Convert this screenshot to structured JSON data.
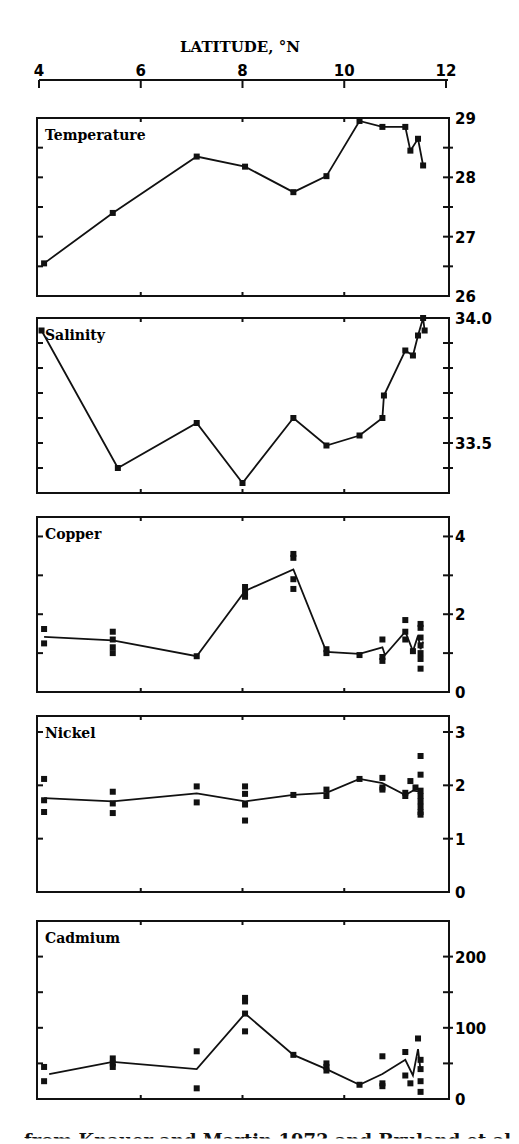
{
  "chart_data": {
    "type": "line",
    "title": "",
    "xlabel": "LATITUDE, °N",
    "x_axis": {
      "min": 4,
      "max": 12,
      "ticks": [
        4,
        6,
        8,
        10,
        12
      ],
      "tick_labels": [
        "4",
        "6",
        "8",
        "10",
        "12"
      ],
      "position": "top"
    },
    "grid": false,
    "legend": null,
    "panels": [
      {
        "name": "Temperature",
        "ylim": [
          26,
          29
        ],
        "y_ticks": [
          26,
          27,
          28,
          29
        ],
        "y_tick_labels": [
          "26",
          "27",
          "28",
          "29"
        ],
        "minor_step": 0.5,
        "line": [
          [
            4.1,
            26.55
          ],
          [
            5.45,
            27.4
          ],
          [
            7.1,
            28.35
          ],
          [
            8.05,
            28.18
          ],
          [
            9.0,
            27.75
          ],
          [
            9.65,
            28.02
          ],
          [
            10.3,
            28.95
          ],
          [
            10.75,
            28.85
          ],
          [
            11.2,
            28.85
          ],
          [
            11.3,
            28.45
          ],
          [
            11.45,
            28.65
          ],
          [
            11.55,
            28.2
          ]
        ],
        "points": [
          [
            4.1,
            26.55
          ],
          [
            5.45,
            27.4
          ],
          [
            7.1,
            28.35
          ],
          [
            8.05,
            28.18
          ],
          [
            9.0,
            27.75
          ],
          [
            9.65,
            28.02
          ],
          [
            10.3,
            28.95
          ],
          [
            10.75,
            28.85
          ],
          [
            11.2,
            28.85
          ],
          [
            11.3,
            28.45
          ],
          [
            11.45,
            28.65
          ],
          [
            11.55,
            28.2
          ]
        ]
      },
      {
        "name": "Salinity",
        "ylim": [
          33.3,
          34.0
        ],
        "y_ticks": [
          33.5,
          34.0
        ],
        "y_tick_labels": [
          "33.5",
          "34.0"
        ],
        "minor_step": 0.1,
        "line": [
          [
            4.05,
            33.95
          ],
          [
            5.55,
            33.4
          ],
          [
            7.1,
            33.58
          ],
          [
            8.0,
            33.34
          ],
          [
            9.0,
            33.6
          ],
          [
            9.65,
            33.49
          ],
          [
            10.3,
            33.53
          ],
          [
            10.75,
            33.6
          ],
          [
            10.78,
            33.69
          ],
          [
            11.2,
            33.87
          ],
          [
            11.35,
            33.85
          ],
          [
            11.45,
            33.93
          ],
          [
            11.55,
            34.0
          ],
          [
            11.58,
            33.95
          ]
        ],
        "points": [
          [
            4.05,
            33.95
          ],
          [
            5.55,
            33.4
          ],
          [
            7.1,
            33.58
          ],
          [
            8.0,
            33.34
          ],
          [
            9.0,
            33.6
          ],
          [
            9.65,
            33.49
          ],
          [
            10.3,
            33.53
          ],
          [
            10.75,
            33.6
          ],
          [
            10.78,
            33.69
          ],
          [
            11.2,
            33.87
          ],
          [
            11.35,
            33.85
          ],
          [
            11.45,
            33.93
          ],
          [
            11.55,
            34.0
          ],
          [
            11.58,
            33.95
          ]
        ]
      },
      {
        "name": "Copper",
        "ylim": [
          0,
          4.5
        ],
        "y_ticks": [
          0,
          2,
          4
        ],
        "y_tick_labels": [
          "0",
          "2",
          "4"
        ],
        "minor_step": 1,
        "line": [
          [
            4.1,
            1.42
          ],
          [
            5.45,
            1.33
          ],
          [
            7.1,
            0.92
          ],
          [
            8.05,
            2.6
          ],
          [
            9.0,
            3.15
          ],
          [
            9.65,
            1.03
          ],
          [
            10.3,
            0.98
          ],
          [
            10.75,
            1.15
          ],
          [
            10.8,
            0.95
          ],
          [
            11.2,
            1.55
          ],
          [
            11.35,
            1.05
          ],
          [
            11.45,
            1.45
          ],
          [
            11.5,
            1.1
          ],
          [
            11.55,
            1.3
          ]
        ],
        "points": [
          [
            4.1,
            1.62
          ],
          [
            4.1,
            1.25
          ],
          [
            5.45,
            1.55
          ],
          [
            5.45,
            1.35
          ],
          [
            5.45,
            1.15
          ],
          [
            5.45,
            1.0
          ],
          [
            7.1,
            0.92
          ],
          [
            8.05,
            2.7
          ],
          [
            8.05,
            2.55
          ],
          [
            8.05,
            2.45
          ],
          [
            9.0,
            3.55
          ],
          [
            9.0,
            3.45
          ],
          [
            9.0,
            2.9
          ],
          [
            9.0,
            2.65
          ],
          [
            9.65,
            1.1
          ],
          [
            9.65,
            1.0
          ],
          [
            10.3,
            0.95
          ],
          [
            10.75,
            1.35
          ],
          [
            10.75,
            0.9
          ],
          [
            10.75,
            0.8
          ],
          [
            11.2,
            1.85
          ],
          [
            11.2,
            1.55
          ],
          [
            11.2,
            1.35
          ],
          [
            11.35,
            1.05
          ],
          [
            11.5,
            1.75
          ],
          [
            11.5,
            1.65
          ],
          [
            11.5,
            1.4
          ],
          [
            11.5,
            1.2
          ],
          [
            11.5,
            1.0
          ],
          [
            11.5,
            0.85
          ],
          [
            11.5,
            0.6
          ]
        ]
      },
      {
        "name": "Nickel",
        "ylim": [
          0,
          3.3
        ],
        "y_ticks": [
          0,
          1,
          2,
          3
        ],
        "y_tick_labels": [
          "0",
          "1",
          "2",
          "3"
        ],
        "minor_step": 1,
        "line": [
          [
            4.1,
            1.76
          ],
          [
            5.45,
            1.7
          ],
          [
            7.1,
            1.85
          ],
          [
            8.05,
            1.7
          ],
          [
            9.0,
            1.82
          ],
          [
            9.65,
            1.86
          ],
          [
            10.3,
            2.12
          ],
          [
            10.75,
            2.04
          ],
          [
            11.2,
            1.82
          ],
          [
            11.35,
            1.9
          ],
          [
            11.5,
            1.88
          ]
        ],
        "points": [
          [
            4.1,
            2.12
          ],
          [
            4.1,
            1.72
          ],
          [
            4.1,
            1.5
          ],
          [
            5.45,
            1.88
          ],
          [
            5.45,
            1.66
          ],
          [
            5.45,
            1.48
          ],
          [
            7.1,
            1.98
          ],
          [
            7.1,
            1.68
          ],
          [
            8.05,
            1.98
          ],
          [
            8.05,
            1.84
          ],
          [
            8.05,
            1.64
          ],
          [
            8.05,
            1.34
          ],
          [
            9.0,
            1.82
          ],
          [
            9.65,
            1.92
          ],
          [
            9.65,
            1.8
          ],
          [
            10.3,
            2.12
          ],
          [
            10.75,
            2.14
          ],
          [
            10.75,
            1.96
          ],
          [
            10.75,
            1.92
          ],
          [
            11.2,
            1.8
          ],
          [
            11.2,
            1.86
          ],
          [
            11.3,
            2.08
          ],
          [
            11.4,
            1.96
          ],
          [
            11.5,
            2.55
          ],
          [
            11.5,
            2.2
          ],
          [
            11.5,
            1.9
          ],
          [
            11.5,
            1.8
          ],
          [
            11.5,
            1.7
          ],
          [
            11.5,
            1.6
          ],
          [
            11.5,
            1.5
          ],
          [
            11.5,
            1.45
          ]
        ]
      },
      {
        "name": "Cadmium",
        "ylim": [
          0,
          250
        ],
        "y_ticks": [
          0,
          100,
          200
        ],
        "y_tick_labels": [
          "0",
          "100",
          "200"
        ],
        "minor_step": 50,
        "line": [
          [
            4.2,
            35
          ],
          [
            5.45,
            52
          ],
          [
            7.1,
            42
          ],
          [
            8.05,
            120
          ],
          [
            9.0,
            62
          ],
          [
            9.65,
            42
          ],
          [
            10.3,
            20
          ],
          [
            10.75,
            35
          ],
          [
            11.2,
            55
          ],
          [
            11.35,
            33
          ],
          [
            11.45,
            70
          ],
          [
            11.5,
            40
          ]
        ],
        "points": [
          [
            4.1,
            45
          ],
          [
            4.1,
            25
          ],
          [
            5.45,
            57
          ],
          [
            5.45,
            50
          ],
          [
            5.45,
            45
          ],
          [
            7.1,
            67
          ],
          [
            7.1,
            15
          ],
          [
            8.05,
            142
          ],
          [
            8.05,
            137
          ],
          [
            8.05,
            120
          ],
          [
            8.05,
            95
          ],
          [
            9.0,
            62
          ],
          [
            9.65,
            50
          ],
          [
            9.65,
            45
          ],
          [
            9.65,
            40
          ],
          [
            10.3,
            20
          ],
          [
            10.75,
            60
          ],
          [
            10.75,
            22
          ],
          [
            10.75,
            18
          ],
          [
            11.2,
            66
          ],
          [
            11.2,
            33
          ],
          [
            11.3,
            22
          ],
          [
            11.45,
            85
          ],
          [
            11.5,
            55
          ],
          [
            11.5,
            42
          ],
          [
            11.5,
            25
          ],
          [
            11.5,
            10
          ]
        ]
      }
    ]
  },
  "caption_fragment": "from Knauer and Martin 1973 and Bruland et al."
}
